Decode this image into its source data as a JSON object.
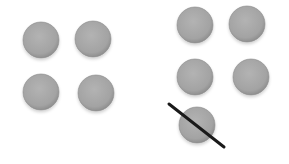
{
  "diagram": {
    "colors": {
      "dot_fill": "#a6a6a6",
      "dot_edge": "#8c8c8c",
      "strike": "#1a1a1a",
      "background": "#ffffff"
    },
    "left_group": {
      "count": 4,
      "dots": [
        {
          "cx": 41,
          "cy": 40
        },
        {
          "cx": 93,
          "cy": 39
        },
        {
          "cx": 41,
          "cy": 92
        },
        {
          "cx": 96,
          "cy": 93
        }
      ]
    },
    "right_group": {
      "count": 5,
      "dots": [
        {
          "cx": 195,
          "cy": 25
        },
        {
          "cx": 247,
          "cy": 24
        },
        {
          "cx": 195,
          "cy": 77
        },
        {
          "cx": 251,
          "cy": 77
        },
        {
          "cx": 197,
          "cy": 125,
          "crossed_out": true
        }
      ],
      "strike_line": {
        "x1": 169,
        "y1": 104,
        "x2": 224,
        "y2": 147
      }
    },
    "dot_radius": 18
  }
}
